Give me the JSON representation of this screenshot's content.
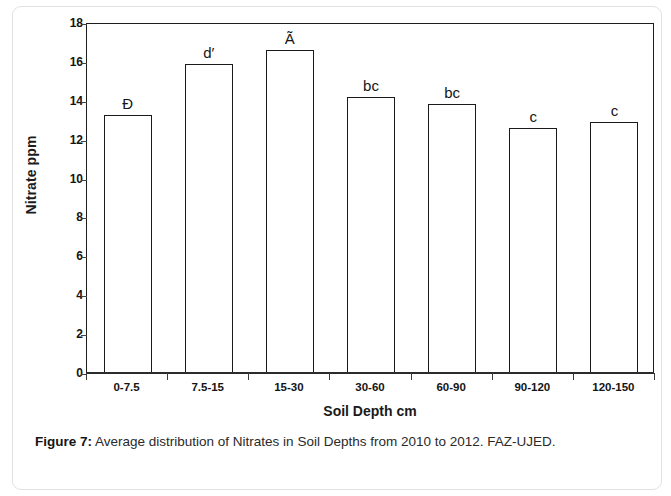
{
  "figure": {
    "caption_label": "Figure 7:",
    "caption_text": " Average distribution of Nitrates in Soil Depths from 2010 to 2012. FAZ-UJED."
  },
  "chart_data": {
    "type": "bar",
    "title": "",
    "xlabel": "Soil Depth cm",
    "ylabel": "Nitrate ppm",
    "categories": [
      "0-7.5",
      "7.5-15",
      "15-30",
      "30-60",
      "60-90",
      "90-120",
      "120-150"
    ],
    "values": [
      13.2,
      15.85,
      16.55,
      14.15,
      13.8,
      12.55,
      12.85
    ],
    "annotations": [
      "Đ",
      "d′",
      "Ã",
      "bc",
      "bc",
      "c",
      "c"
    ],
    "ylim": [
      0,
      18
    ],
    "yticks": [
      0,
      2,
      4,
      6,
      8,
      10,
      12,
      14,
      16,
      18
    ],
    "ytick_labels": [
      "0",
      "2",
      "4",
      "6",
      "8",
      "10",
      "12",
      "14",
      "16",
      "18"
    ],
    "grid": false,
    "legend": false,
    "bar_facecolor": "#ffffff",
    "bar_edgecolor": "#1a1a1a",
    "axis_color": "#1d1d1d"
  }
}
